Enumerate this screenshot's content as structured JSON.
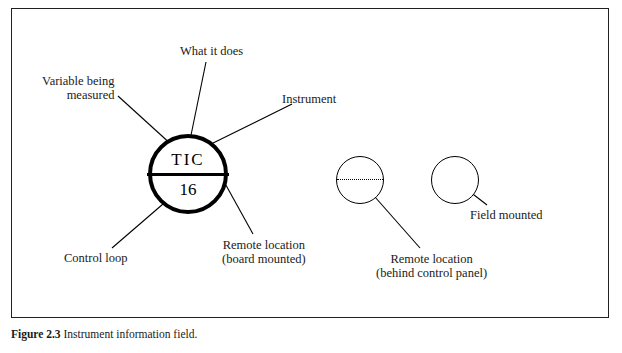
{
  "figure": {
    "caption_bold": "Figure 2.3",
    "caption_rest": "  Instrument information field.",
    "frame_border_color": "#231f20"
  },
  "instrument_bubble": {
    "top_text": "TIC",
    "bottom_text": "16",
    "outline_color": "#000000"
  },
  "secondary_bubbles": {
    "behind_panel_label": "dotted-line-bubble",
    "field_label": "plain-bubble"
  },
  "annotations": {
    "what_it_does": "What it does",
    "variable_being_measured": "Variable being\nmeasured",
    "variable_line1": "Variable being",
    "variable_line2": "measured",
    "instrument": "Instrument",
    "control_loop": "Control loop",
    "remote_line1": "Remote location",
    "remote_line2": "(board mounted)",
    "behind_line1": "Remote location",
    "behind_line2": "(behind control panel)",
    "field_mounted": "Field mounted"
  }
}
